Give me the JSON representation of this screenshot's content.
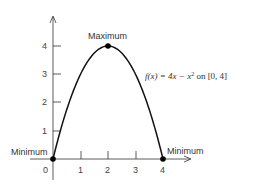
{
  "chart_data": {
    "type": "line",
    "title": "",
    "function_label": "f(x) = 4x − x² on [0, 4]",
    "function_parts": {
      "fx": "f(x) = 4x − x",
      "exp": "2",
      "domain": " on [0, 4]"
    },
    "xlabel": "",
    "ylabel": "",
    "xlim": [
      0,
      4
    ],
    "ylim": [
      0,
      4
    ],
    "x_ticks": [
      "0",
      "1",
      "2",
      "3",
      "4"
    ],
    "y_ticks": [
      "1",
      "2",
      "3",
      "4"
    ],
    "series": [
      {
        "name": "f(x) = 4x - x^2",
        "x": [
          0,
          0.5,
          1,
          1.5,
          2,
          2.5,
          3,
          3.5,
          4
        ],
        "y": [
          0,
          1.75,
          3,
          3.75,
          4,
          3.75,
          3,
          1.75,
          0
        ]
      }
    ],
    "points": [
      {
        "x": 0,
        "y": 0,
        "label": "Minimum"
      },
      {
        "x": 2,
        "y": 4,
        "label": "Maximum"
      },
      {
        "x": 4,
        "y": 0,
        "label": "Minimum"
      }
    ],
    "grid": false,
    "legend": "none"
  },
  "labels": {
    "maximum": "Maximum",
    "minimum_left": "Minimum",
    "minimum_right": "Minimum"
  }
}
